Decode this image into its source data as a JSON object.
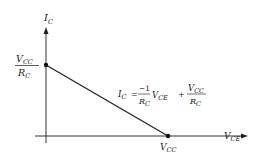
{
  "diagram": {
    "type": "load-line",
    "y_axis": {
      "label_main": "I",
      "label_sub": "C"
    },
    "x_axis": {
      "label_main": "V",
      "label_sub": "CE"
    },
    "y_intercept": {
      "numerator_main": "V",
      "numerator_sub": "CC",
      "denominator_main": "R",
      "denominator_sub": "C"
    },
    "x_intercept": {
      "label_main": "V",
      "label_sub": "CC"
    },
    "equation": {
      "lhs_main": "I",
      "lhs_sub": "C",
      "equals": "=",
      "coef_numerator": "−1",
      "coef_den_main": "R",
      "coef_den_sub": "C",
      "var_main": "V",
      "var_sub": "CE",
      "plus": "+",
      "const_num_main": "V",
      "const_num_sub": "CC",
      "const_den_main": "R",
      "const_den_sub": "C"
    },
    "colors": {
      "line": "#222222",
      "background": "#ffffff"
    }
  }
}
